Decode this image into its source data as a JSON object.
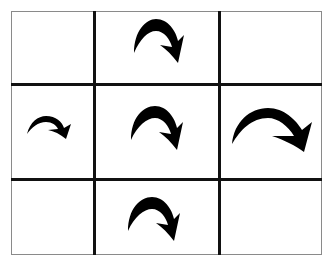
{
  "diagram": {
    "type": "3x3 grid of curved arrows",
    "grid": {
      "rows": 3,
      "cols": 3,
      "line_color": "#111111",
      "border_color": "#8a8a8a",
      "background": "#ffffff"
    },
    "cells": [
      {
        "row": 0,
        "col": 0,
        "content": "empty"
      },
      {
        "row": 0,
        "col": 1,
        "content": "curved-arrow",
        "icon": "curved-arrow-clockwise-icon"
      },
      {
        "row": 0,
        "col": 2,
        "content": "empty"
      },
      {
        "row": 1,
        "col": 0,
        "content": "curved-arrow",
        "icon": "small-curved-arrow-icon"
      },
      {
        "row": 1,
        "col": 1,
        "content": "curved-arrow",
        "icon": "curved-arrow-clockwise-icon"
      },
      {
        "row": 1,
        "col": 2,
        "content": "curved-arrow",
        "icon": "wide-curved-arrow-icon"
      },
      {
        "row": 2,
        "col": 0,
        "content": "empty"
      },
      {
        "row": 2,
        "col": 1,
        "content": "curved-arrow",
        "icon": "curved-arrow-clockwise-icon"
      },
      {
        "row": 2,
        "col": 2,
        "content": "empty"
      }
    ],
    "arrow_color": "#000000"
  }
}
